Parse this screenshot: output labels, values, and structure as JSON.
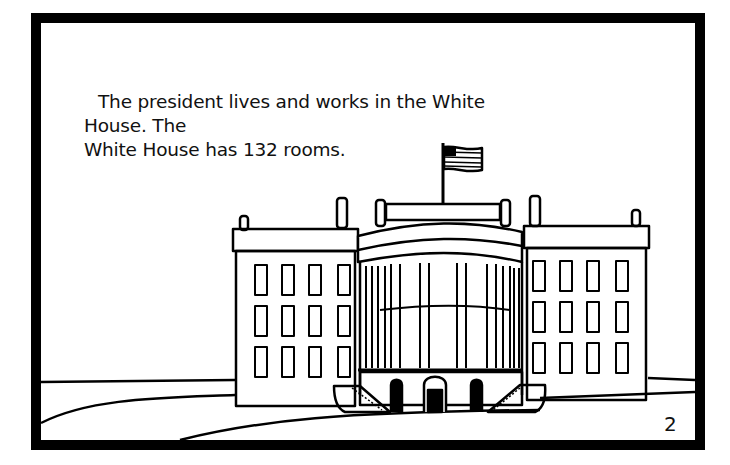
{
  "page": {
    "caption_line1": "The president lives and works in the White House. The",
    "caption_line2": "White House has 132 rooms.",
    "page_number": "2"
  },
  "illustration": {
    "subject": "white-house-line-drawing",
    "colors": {
      "ink": "#000000",
      "paper": "#ffffff"
    }
  }
}
